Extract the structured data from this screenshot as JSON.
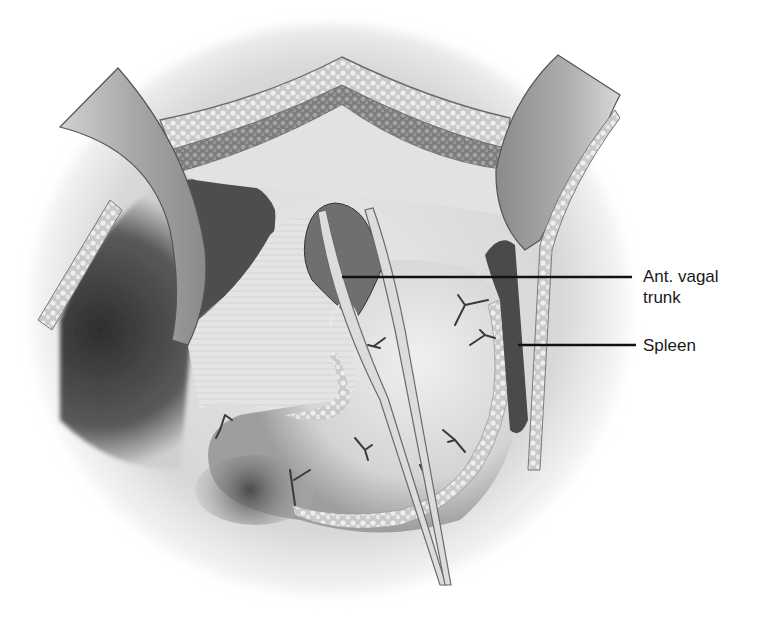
{
  "figure": {
    "style": "grayscale pencil rendering",
    "colors": {
      "background": "#ffffff",
      "tissue_light": "#e6e6e6",
      "tissue_mid": "#bdbdbd",
      "cavity_dark": "#3a3a3a",
      "retractor": "#9a9a9a",
      "leader_line": "#111111",
      "label_text": "#1a1a1a"
    }
  },
  "labels": [
    {
      "id": "ant-vagal-trunk",
      "text": "Ant. vagal\ntrunk",
      "line_from": [
        342,
        277
      ],
      "line_to": [
        632,
        277
      ]
    },
    {
      "id": "spleen",
      "text": "Spleen",
      "line_from": [
        518,
        345
      ],
      "line_to": [
        636,
        345
      ]
    }
  ]
}
